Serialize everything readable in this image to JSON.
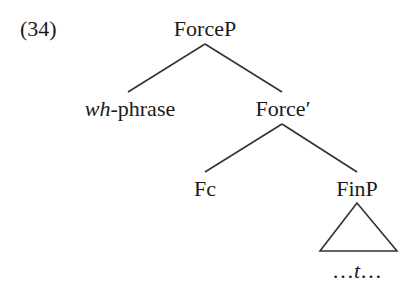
{
  "example_number": "(34)",
  "nodes": {
    "root": {
      "label": "ForceP"
    },
    "spec": {
      "label_italic": "wh",
      "label_rest": "-phrase"
    },
    "bar": {
      "label": "Force′"
    },
    "head": {
      "label": "Fc"
    },
    "complement": {
      "label": "FinP"
    },
    "terminal": {
      "prefix": "…",
      "trace": "t",
      "suffix": "…"
    }
  },
  "colors": {
    "text": "#1a1a1a",
    "lines": "#333333",
    "background": "#ffffff"
  }
}
